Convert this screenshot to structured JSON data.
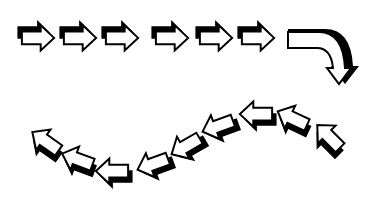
{
  "diagram": {
    "colors": {
      "fill": "#ffffff",
      "outline": "#000000",
      "shadow": "#000000",
      "background": "#ffffff"
    },
    "top_row": {
      "direction": "right",
      "arrows": [
        {
          "id": 1,
          "x": 17,
          "y": 20,
          "rotation": 0
        },
        {
          "id": 2,
          "x": 59,
          "y": 20,
          "rotation": 0
        },
        {
          "id": 3,
          "x": 101,
          "y": 20,
          "rotation": 0
        },
        {
          "id": 4,
          "x": 151,
          "y": 20,
          "rotation": 0
        },
        {
          "id": 5,
          "x": 195,
          "y": 20,
          "rotation": 0
        },
        {
          "id": 6,
          "x": 237,
          "y": 20,
          "rotation": 0
        }
      ]
    },
    "turn_arrow": {
      "id": 7,
      "shape": "curved-arrow",
      "direction": "right-then-down"
    },
    "bottom_row": {
      "direction": "left",
      "arrows": [
        {
          "id": 8,
          "x": 307,
          "y": 120,
          "rotation": 225
        },
        {
          "id": 9,
          "x": 271,
          "y": 102,
          "rotation": 205
        },
        {
          "id": 10,
          "x": 235,
          "y": 98,
          "rotation": 180
        },
        {
          "id": 11,
          "x": 197,
          "y": 110,
          "rotation": 160
        },
        {
          "id": 12,
          "x": 165,
          "y": 130,
          "rotation": 150
        },
        {
          "id": 13,
          "x": 132,
          "y": 148,
          "rotation": 160
        },
        {
          "id": 14,
          "x": 91,
          "y": 155,
          "rotation": 180
        },
        {
          "id": 15,
          "x": 56,
          "y": 143,
          "rotation": 200
        },
        {
          "id": 16,
          "x": 24,
          "y": 125,
          "rotation": 215
        }
      ]
    }
  }
}
